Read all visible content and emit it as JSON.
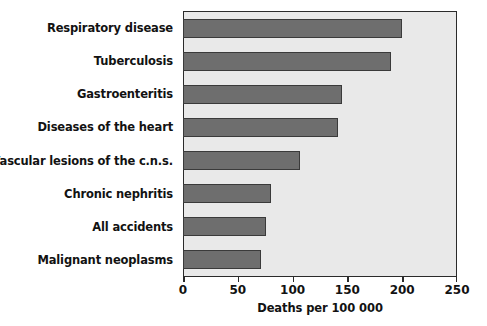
{
  "chart_data": {
    "type": "bar",
    "orientation": "horizontal",
    "title": "",
    "xlabel": "Deaths per 100 000",
    "ylabel": "",
    "xlim": [
      0,
      250
    ],
    "xticks": [
      0,
      50,
      100,
      150,
      200,
      250
    ],
    "xtick_labels": [
      "0",
      "50",
      "100",
      "150",
      "200",
      "250"
    ],
    "grid": false,
    "legend": "none",
    "bar_color": "#6e6e6e",
    "bar_edge_color": "#3a3a3a",
    "plot_background": "#e9e9e9",
    "frame_color": "#2b2b2b",
    "categories": [
      "Respiratory disease",
      "Tuberculosis",
      "Gastroenteritis",
      "Diseases of the heart",
      "Vascular lesions of the c.n.s.",
      "Chronic nephritis",
      "All accidents",
      "Malignant neoplasms"
    ],
    "values": [
      200,
      190,
      145,
      141,
      107,
      80,
      76,
      71
    ]
  }
}
